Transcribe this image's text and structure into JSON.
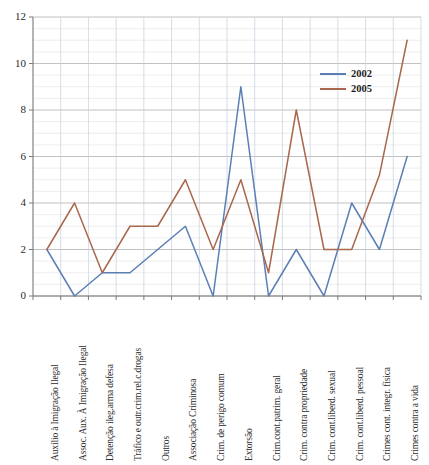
{
  "chart_data": {
    "type": "line",
    "title": "",
    "xlabel": "",
    "ylabel": "",
    "ylim": [
      0,
      12
    ],
    "yticks": [
      0,
      2,
      4,
      6,
      8,
      10,
      12
    ],
    "grid": true,
    "legend_position": "inside-top-right",
    "categories": [
      "Auxílio à Imigração Ilegal",
      "Assoc. Aux. À Imigração Ilegal",
      "Detenção ileg.arma defesa",
      "Tráfico e outr.crim.rel.c.drogas",
      "Outros",
      "Associação Criminosa",
      "Crim. de perigo comum",
      "Extorsão",
      "Crim.cont.patrim. geral",
      "Crim. contra propriedade",
      "Crim. cont.liberd. sexual",
      "Crim. cont.liberd. pessoal",
      "Crimes cont. integr. física",
      "Crimes contra a vida"
    ],
    "series": [
      {
        "name": "2002",
        "color": "#5B7FB5",
        "values": [
          2,
          0,
          1,
          1,
          2,
          3,
          0,
          9,
          0,
          2,
          0,
          4,
          2,
          6
        ]
      },
      {
        "name": "2005",
        "color": "#A9674E",
        "values": [
          2,
          4,
          1,
          3,
          3,
          5,
          2,
          5,
          1,
          8,
          2,
          2,
          5.2,
          11
        ]
      }
    ]
  },
  "axis": {
    "ytick_labels": [
      "12",
      "10",
      "8",
      "6",
      "4",
      "2",
      "0"
    ]
  },
  "legend": {
    "items": [
      {
        "label": "2002",
        "color": "#5B7FB5"
      },
      {
        "label": "2005",
        "color": "#A9674E"
      }
    ]
  }
}
